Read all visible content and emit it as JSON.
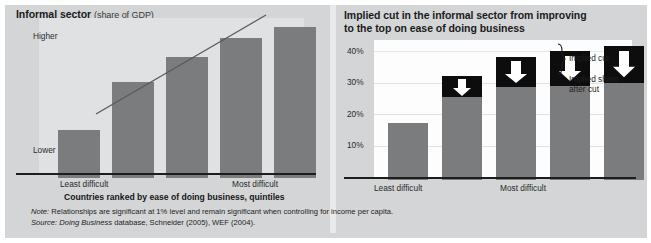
{
  "left_chart": {
    "title_main": "Informal sector",
    "title_sub": "(share of GDP)",
    "y_top_label": "Higher",
    "y_bottom_label": "Lower",
    "x_left_label": "Least difficult",
    "x_right_label": "Most difficult",
    "x_caption": "Countries ranked by ease of doing business, quintiles"
  },
  "right_chart": {
    "title_line1": "Implied cut in the informal sector from improving",
    "title_line2": "to the top on ease of doing business",
    "x_left_label": "Least difficult",
    "x_right_label": "Most difficult",
    "legend_cut": "Implied cut",
    "legend_after_line1": "Implied share",
    "legend_after_line2": "after cut"
  },
  "footer": {
    "note_label": "Note:",
    "note_text": " Relationships are significant at 1% level and remain significant when controlling for income per capita.",
    "source_label": "Source:",
    "source_italic": " Doing Business",
    "source_text": " database, Schneider (2005), WEF (2004)."
  },
  "colors": {
    "bar": "#7b7c7e",
    "cap": "#0d0d0d",
    "arrow": "#ffffff",
    "panel_bg": "#d4d5d7",
    "left_plot_bg": "#e0e1e3",
    "right_plot_bg": "#fdfdfd",
    "axis": "#1d1d1d",
    "gridline": "#dfe0e2"
  },
  "chart_data": [
    {
      "type": "bar",
      "title": "Informal sector (share of GDP)",
      "xlabel": "Countries ranked by ease of doing business, quintiles",
      "ylabel": "Share of GDP",
      "categories": [
        "1",
        "2",
        "3",
        "4",
        "5"
      ],
      "tick_labels": [
        "Least difficult",
        "",
        "",
        "",
        "Most difficult"
      ],
      "y_tick_labels": [
        "Lower",
        "Higher"
      ],
      "values": [
        31,
        62,
        78,
        90,
        97
      ],
      "ylim": [
        0,
        100
      ],
      "grid": false,
      "legend": "none",
      "annotations": [
        "trend line (upward sloping, left to right)"
      ],
      "series": [
        {
          "name": "Informal sector share of GDP",
          "values": [
            31,
            62,
            78,
            90,
            97
          ]
        }
      ]
    },
    {
      "type": "bar",
      "title": "Implied cut in the informal sector from improving to the top on ease of doing business",
      "xlabel": "Countries ranked by ease of doing business, quintiles",
      "ylabel": "Share of GDP (%)",
      "categories": [
        "1",
        "2",
        "3",
        "4",
        "5"
      ],
      "tick_labels": [
        "Least difficult",
        "",
        "",
        "",
        "Most difficult"
      ],
      "y_ticks": [
        10,
        20,
        30,
        40
      ],
      "y_tick_labels": [
        "10%",
        "20%",
        "30%",
        "40%"
      ],
      "ylim": [
        0,
        43
      ],
      "grid": true,
      "legend_position": "right",
      "stacked": true,
      "series": [
        {
          "name": "Implied share after cut",
          "values": [
            18,
            26.5,
            29.5,
            30,
            30.5
          ]
        },
        {
          "name": "Implied cut",
          "values": [
            0,
            5.5,
            9,
            11,
            11.5
          ]
        }
      ],
      "totals": [
        18,
        32,
        38.5,
        41,
        42
      ],
      "annotations": [
        "white downward arrow inside each implied-cut segment"
      ]
    }
  ]
}
